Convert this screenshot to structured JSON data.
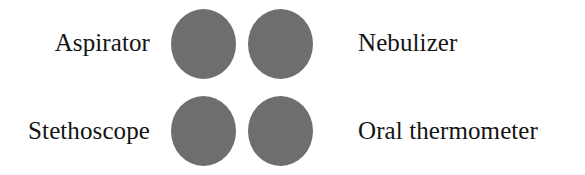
{
  "figure": {
    "background_color": "#ffffff",
    "dot_color": "#6e6e6e",
    "text_color": "#141414"
  },
  "rows": [
    {
      "left_label": "Aspirator",
      "right_label": "Nebulizer",
      "left_dot_name": "dot-aspirator",
      "right_dot_name": "dot-nebulizer"
    },
    {
      "left_label": "Stethoscope",
      "right_label": "Oral thermometer",
      "left_dot_name": "dot-stethoscope",
      "right_dot_name": "dot-oral-thermometer"
    }
  ]
}
